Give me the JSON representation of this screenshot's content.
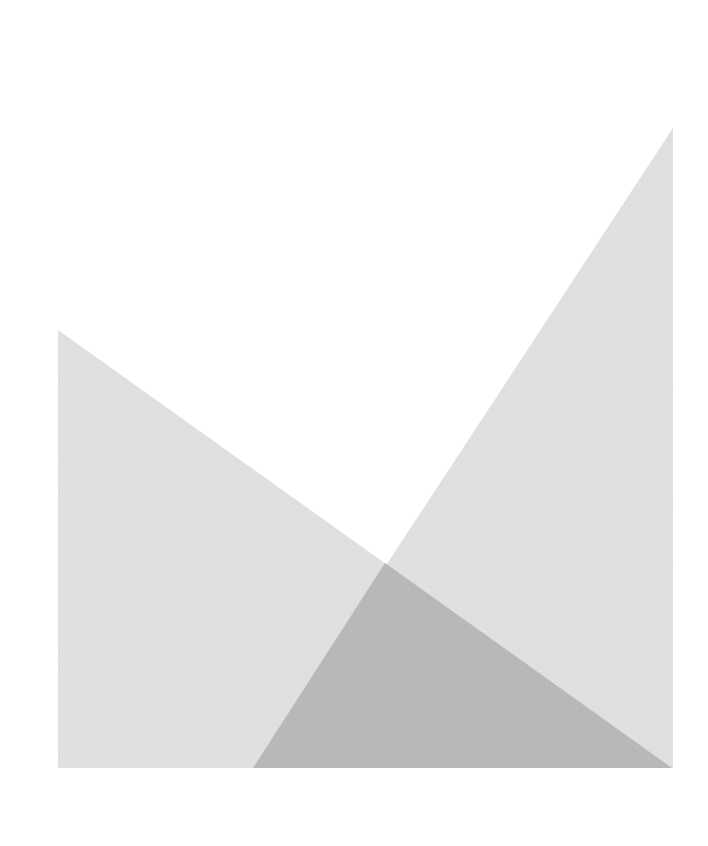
{
  "canvas": {
    "width": 708,
    "height": 846,
    "background": "#ffffff"
  },
  "shapes": {
    "left_triangle": {
      "points": "58,330 58,768 672,768",
      "fill": "#e3e3e3"
    },
    "right_triangle": {
      "points": "673,128 673,768 253,768",
      "fill": "#e3e3e3"
    },
    "overlap_triangle": {
      "points": "385,563 253,768 672,768",
      "fill": "#b8b8b8"
    }
  },
  "colors": {
    "light_gray": "#e3e3e3",
    "overlap_gray": "#b8b8b8"
  }
}
